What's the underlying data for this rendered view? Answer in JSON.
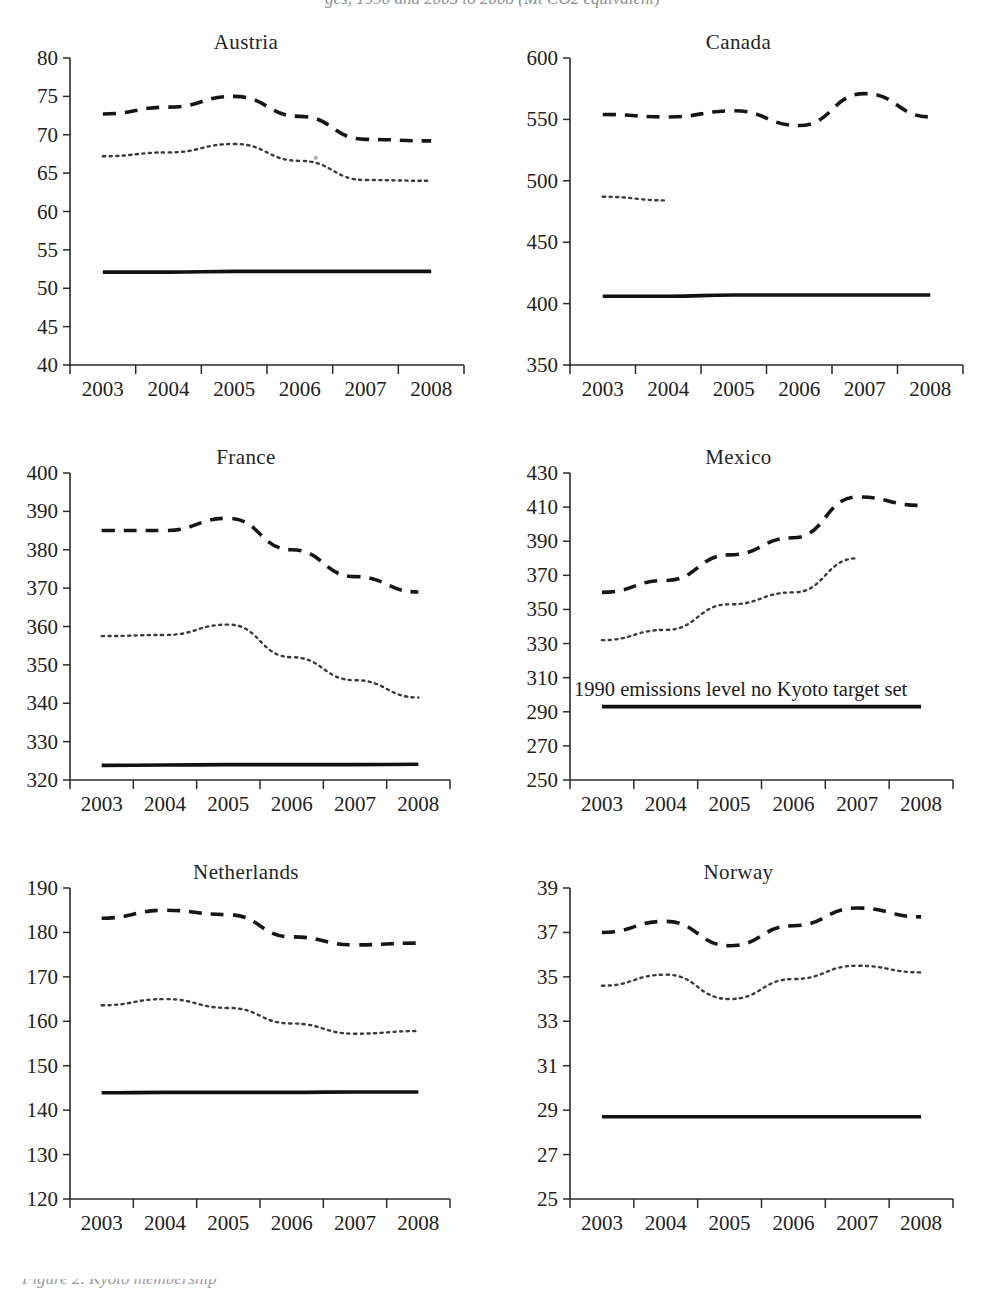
{
  "figure": {
    "top_cut_text": "ges, 1990 and 2003 to 2008 (Mt CO2 equivalent)",
    "bottom_cut_text": "Figure 2. Kyoto membership"
  },
  "axis": {
    "x_tick_labels": [
      "2003",
      "2004",
      "2005",
      "2006",
      "2007",
      "2008"
    ]
  },
  "series_names": {
    "dashed": "total emissions including LULUCF excluded",
    "dotted": "total emissions excluding LULUCF",
    "solid": "1990 emissions level / Kyoto target"
  },
  "chart_data": [
    {
      "type": "line",
      "title": "Austria",
      "xlabel": "",
      "ylabel": "",
      "x": [
        "2003",
        "2004",
        "2005",
        "2006",
        "2007",
        "2008"
      ],
      "ylim": [
        40,
        80
      ],
      "yticks": [
        40,
        45,
        50,
        55,
        60,
        65,
        70,
        75,
        80
      ],
      "grid": false,
      "legend": "none",
      "series": [
        {
          "name": "dashed",
          "style": "dashed",
          "values": [
            72.7,
            73.6,
            75.0,
            72.4,
            69.4,
            69.2
          ]
        },
        {
          "name": "dotted",
          "style": "dotted",
          "values": [
            67.2,
            67.7,
            68.8,
            66.6,
            64.1,
            64.0
          ]
        },
        {
          "name": "solid",
          "style": "solid",
          "values": [
            52.1,
            52.1,
            52.2,
            52.2,
            52.2,
            52.2
          ]
        }
      ],
      "annotation": ""
    },
    {
      "type": "line",
      "title": "Canada",
      "xlabel": "",
      "ylabel": "",
      "x": [
        "2003",
        "2004",
        "2005",
        "2006",
        "2007",
        "2008"
      ],
      "ylim": [
        350,
        600
      ],
      "yticks": [
        350,
        400,
        450,
        500,
        550,
        600
      ],
      "grid": false,
      "legend": "none",
      "series": [
        {
          "name": "dashed",
          "style": "dashed",
          "values": [
            554,
            552,
            557,
            545,
            571,
            552
          ]
        },
        {
          "name": "dotted",
          "style": "dotted",
          "values": [
            487,
            484,
            null,
            null,
            null,
            null
          ]
        },
        {
          "name": "solid",
          "style": "solid",
          "values": [
            406,
            406,
            407,
            407,
            407,
            407
          ]
        }
      ],
      "annotation": ""
    },
    {
      "type": "line",
      "title": "France",
      "xlabel": "",
      "ylabel": "",
      "x": [
        "2003",
        "2004",
        "2005",
        "2006",
        "2007",
        "2008"
      ],
      "ylim": [
        320,
        400
      ],
      "yticks": [
        320,
        330,
        340,
        350,
        360,
        370,
        380,
        390,
        400
      ],
      "grid": false,
      "legend": "none",
      "series": [
        {
          "name": "dashed",
          "style": "dashed",
          "values": [
            385.0,
            385.0,
            388.2,
            380.0,
            373.0,
            369.0
          ]
        },
        {
          "name": "dotted",
          "style": "dotted",
          "values": [
            357.5,
            357.8,
            360.5,
            352.0,
            346.0,
            341.5
          ]
        },
        {
          "name": "solid",
          "style": "solid",
          "values": [
            323.8,
            323.9,
            324.0,
            324.0,
            324.0,
            324.1
          ]
        }
      ],
      "annotation": ""
    },
    {
      "type": "line",
      "title": "Mexico",
      "xlabel": "",
      "ylabel": "",
      "x": [
        "2003",
        "2004",
        "2005",
        "2006",
        "2007",
        "2008"
      ],
      "ylim": [
        250,
        430
      ],
      "yticks": [
        250,
        270,
        290,
        310,
        330,
        350,
        370,
        390,
        410,
        430
      ],
      "grid": false,
      "legend": "none",
      "series": [
        {
          "name": "dashed",
          "style": "dashed",
          "values": [
            360,
            367,
            382,
            392,
            416,
            411
          ]
        },
        {
          "name": "dotted",
          "style": "dotted",
          "values": [
            332,
            338,
            353,
            360,
            380,
            null
          ]
        },
        {
          "name": "solid",
          "style": "solid",
          "values": [
            293,
            293,
            293,
            293,
            293,
            293
          ]
        }
      ],
      "annotation": "1990 emissions level no Kyoto target set"
    },
    {
      "type": "line",
      "title": "Netherlands",
      "xlabel": "",
      "ylabel": "",
      "x": [
        "2003",
        "2004",
        "2005",
        "2006",
        "2007",
        "2008"
      ],
      "ylim": [
        120,
        190
      ],
      "yticks": [
        120,
        130,
        140,
        150,
        160,
        170,
        180,
        190
      ],
      "grid": false,
      "legend": "none",
      "series": [
        {
          "name": "dashed",
          "style": "dashed",
          "values": [
            183.2,
            185.0,
            184.0,
            179.0,
            177.2,
            177.6
          ]
        },
        {
          "name": "dotted",
          "style": "dotted",
          "values": [
            163.6,
            165.0,
            163.0,
            159.5,
            157.2,
            157.8
          ]
        },
        {
          "name": "solid",
          "style": "solid",
          "values": [
            143.9,
            144.0,
            144.0,
            144.0,
            144.1,
            144.1
          ]
        }
      ],
      "annotation": ""
    },
    {
      "type": "line",
      "title": "Norway",
      "xlabel": "",
      "ylabel": "",
      "x": [
        "2003",
        "2004",
        "2005",
        "2006",
        "2007",
        "2008"
      ],
      "ylim": [
        25,
        39
      ],
      "yticks": [
        25,
        27,
        29,
        31,
        33,
        35,
        37,
        39
      ],
      "grid": false,
      "legend": "none",
      "series": [
        {
          "name": "dashed",
          "style": "dashed",
          "values": [
            37.0,
            37.5,
            36.4,
            37.3,
            38.1,
            37.7
          ]
        },
        {
          "name": "dotted",
          "style": "dotted",
          "values": [
            34.6,
            35.1,
            34.0,
            34.9,
            35.5,
            35.2
          ]
        },
        {
          "name": "solid",
          "style": "solid",
          "values": [
            28.7,
            28.7,
            28.7,
            28.7,
            28.7,
            28.7
          ]
        }
      ],
      "annotation": ""
    }
  ]
}
